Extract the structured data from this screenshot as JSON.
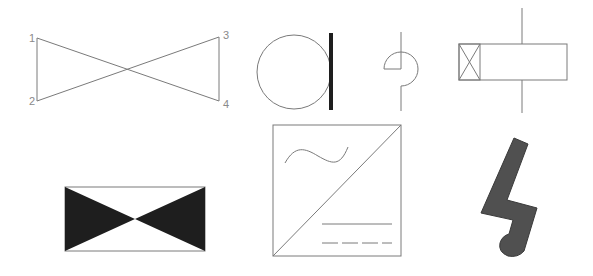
{
  "canvas": {
    "width": 593,
    "height": 276,
    "background": "#ffffff"
  },
  "colors": {
    "line": "#7a7a7a",
    "fill_dark": "#1e1e1e",
    "fill_gray": "#505050",
    "label": "#8a8a8a"
  },
  "symbols": [
    {
      "id": "crossed-quad",
      "labels": [
        {
          "text": "1",
          "x": 29,
          "y": 42
        },
        {
          "text": "2",
          "x": 29,
          "y": 105
        },
        {
          "text": "3",
          "x": 223,
          "y": 39
        },
        {
          "text": "4",
          "x": 223,
          "y": 108
        }
      ]
    },
    {
      "id": "circle-with-bar"
    },
    {
      "id": "semicircle-line"
    },
    {
      "id": "rect-with-crossed-box"
    },
    {
      "id": "filled-bowtie-rect"
    },
    {
      "id": "square-diagonal-wave-lines"
    },
    {
      "id": "lightning-bolt"
    }
  ]
}
